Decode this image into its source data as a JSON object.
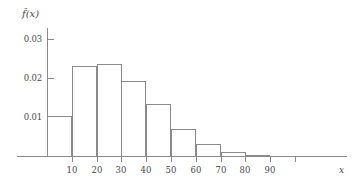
{
  "chart_data": {
    "type": "bar",
    "title": "",
    "subtitle": "",
    "xlabel": "x",
    "ylabel": "f̂(x)",
    "grid": false,
    "legend": null,
    "xlim": [
      0,
      110
    ],
    "ylim": [
      0,
      0.0335
    ],
    "x_ticks": [
      10,
      20,
      30,
      40,
      50,
      60,
      70,
      80,
      90,
      100
    ],
    "x_tick_labels": [
      "10",
      "20",
      "30",
      "40",
      "50",
      "60",
      "70",
      "80",
      "90",
      ""
    ],
    "y_ticks": [
      0.01,
      0.02,
      0.03
    ],
    "y_tick_labels": [
      "0.01",
      "0.02",
      "0.03"
    ],
    "bin_edges": [
      0,
      10,
      20,
      30,
      40,
      50,
      60,
      70,
      80,
      90
    ],
    "categories": [
      "0-10",
      "10-20",
      "20-30",
      "30-40",
      "40-50",
      "50-60",
      "60-70",
      "70-80",
      "80-90"
    ],
    "values": [
      0.0103,
      0.0231,
      0.0236,
      0.0193,
      0.0134,
      0.0069,
      0.003,
      0.001,
      0.0002
    ],
    "bar_color": "#ffffff",
    "bar_edge_color": "#8a8a8a",
    "axis_color": "#8a8a8a",
    "text_color": "#4a4a4a"
  }
}
